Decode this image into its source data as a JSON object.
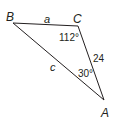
{
  "figure": {
    "type": "triangle",
    "vertices": {
      "B": {
        "label": "B",
        "x": 13,
        "y": 23
      },
      "C": {
        "label": "C",
        "x": 78,
        "y": 26
      },
      "A": {
        "label": "A",
        "x": 104,
        "y": 100
      }
    },
    "sides": {
      "BC": {
        "label": "a"
      },
      "CA": {
        "label": "24"
      },
      "BA": {
        "label": "c"
      }
    },
    "angles": {
      "C": {
        "label": "112°"
      },
      "A": {
        "label": "30°"
      }
    },
    "colors": {
      "stroke": "#231f20",
      "text": "#231f20",
      "background": "#ffffff"
    }
  }
}
